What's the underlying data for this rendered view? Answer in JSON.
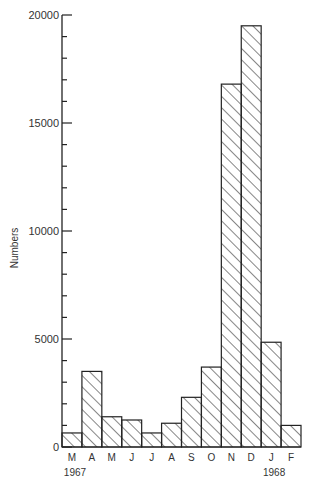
{
  "chart_data": {
    "type": "bar",
    "title": "",
    "xlabel": "",
    "ylabel": "Numbers",
    "categories": [
      "M",
      "A",
      "M",
      "J",
      "J",
      "A",
      "S",
      "O",
      "N",
      "D",
      "J",
      "F"
    ],
    "period_labels": [
      "Mar 1967",
      "Apr 1967",
      "May 1967",
      "Jun 1967",
      "Jul 1967",
      "Aug 1967",
      "Sep 1967",
      "Oct 1967",
      "Nov 1967",
      "Dec 1967",
      "Jan 1968",
      "Feb 1968"
    ],
    "values": [
      650,
      3500,
      1400,
      1250,
      650,
      1100,
      2300,
      3700,
      16800,
      19500,
      4850,
      1000
    ],
    "ylim": [
      0,
      20000
    ],
    "yticks": [
      0,
      5000,
      10000,
      15000,
      20000
    ],
    "ytick_labels": [
      "0",
      "5000",
      "10000",
      "15000",
      "20000"
    ],
    "minor_ytick_step": 1000,
    "year_annotations": [
      {
        "label": "1967",
        "under_index": 0
      },
      {
        "label": "1968",
        "under_index": 10
      }
    ],
    "bar_style": "diagonal-hatch",
    "grid": false,
    "legend": null
  },
  "colors": {
    "ink": "#222222",
    "background": "#ffffff"
  }
}
